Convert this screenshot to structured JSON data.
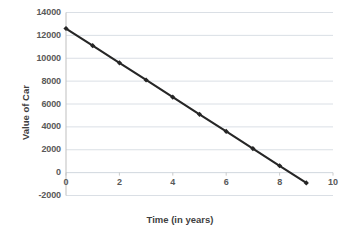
{
  "chart_data": {
    "type": "line",
    "title": "",
    "xlabel": "Time (in years)",
    "ylabel": "Value of Car",
    "x": [
      0,
      1,
      2,
      3,
      4,
      5,
      6,
      7,
      8,
      9
    ],
    "values": [
      12600,
      11100,
      9600,
      8100,
      6600,
      5100,
      3600,
      2100,
      600,
      -900
    ],
    "series": [
      {
        "name": "Value of Car",
        "values": [
          12600,
          11100,
          9600,
          8100,
          6600,
          5100,
          3600,
          2100,
          600,
          -900
        ]
      }
    ],
    "xlim": [
      0,
      10
    ],
    "ylim": [
      -2000,
      14000
    ],
    "x_ticks": [
      0,
      2,
      4,
      6,
      8,
      10
    ],
    "x_tick_labels": [
      "0",
      "2",
      "4",
      "6",
      "8",
      "10"
    ],
    "y_ticks": [
      -2000,
      0,
      2000,
      4000,
      6000,
      8000,
      10000,
      12000,
      14000
    ],
    "y_tick_labels": [
      "-2000",
      "0",
      "2000",
      "4000",
      "6000",
      "8000",
      "10000",
      "12000",
      "14000"
    ],
    "grid": true,
    "grid_axis": "y",
    "legend": false,
    "legend_position": "none",
    "line_color": "#262626",
    "marker_color": "#262626",
    "marker": "diamond",
    "grid_color": "#d0d7de",
    "axis_color": "#bfbfbf",
    "background_color": "#ffffff",
    "annotations": []
  }
}
